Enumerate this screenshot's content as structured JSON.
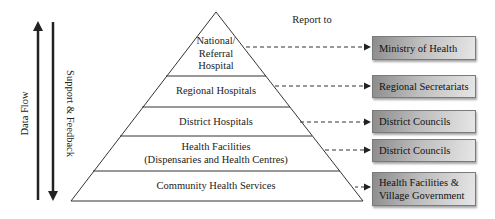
{
  "diagram": {
    "left_arrows": {
      "data_flow": "Data Flow",
      "support_feedback": "Support & Feedback"
    },
    "report_to_label": "Report to",
    "levels": [
      {
        "label": "National/ Referral Hospital",
        "lines": [
          "National/",
          "Referral",
          "Hospital"
        ],
        "reports_to": "Ministry of Health"
      },
      {
        "label": "Regional Hospitals",
        "lines": [
          "Regional Hospitals"
        ],
        "reports_to": "Regional Secretariats"
      },
      {
        "label": "District Hospitals",
        "lines": [
          "District Hospitals"
        ],
        "reports_to": "District Councils"
      },
      {
        "label": "Health Facilities (Dispensaries and Health Centres)",
        "lines": [
          "Health Facilities",
          "(Dispensaries and Health Centres)"
        ],
        "reports_to": "District Councils"
      },
      {
        "label": "Community Health Services",
        "lines": [
          "Community Health Services"
        ],
        "reports_to_lines": [
          "Health Facilities &",
          "Village Government"
        ]
      }
    ],
    "colors": {
      "line": "#222222",
      "box_dark": "#8c8c8c",
      "box_light": "#e6e6e6"
    }
  }
}
